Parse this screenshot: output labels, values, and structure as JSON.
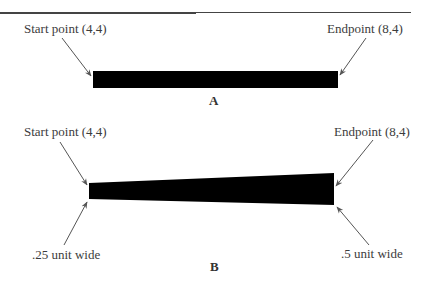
{
  "figure_a": {
    "start_label": "Start point (4,4)",
    "end_label": "Endpoint (8,4)",
    "caption": "A",
    "shape": {
      "type": "rectangle",
      "fill": "#000000",
      "x1": 93,
      "x2": 338,
      "y_top": 71,
      "y_bottom": 88
    }
  },
  "figure_b": {
    "start_label": "Start point (4,4)",
    "end_label": "Endpoint (8,4)",
    "start_width_label": ".25 unit wide",
    "end_width_label": ".5 unit wide",
    "caption": "B",
    "shape": {
      "type": "tapered-polygon",
      "fill": "#000000",
      "points": [
        [
          89,
          183
        ],
        [
          334,
          173
        ],
        [
          334,
          205
        ],
        [
          89,
          199
        ]
      ]
    }
  },
  "colors": {
    "fill": "#000000",
    "arrow": "#555555",
    "text": "#3c3c3c",
    "rule": "#444444"
  }
}
